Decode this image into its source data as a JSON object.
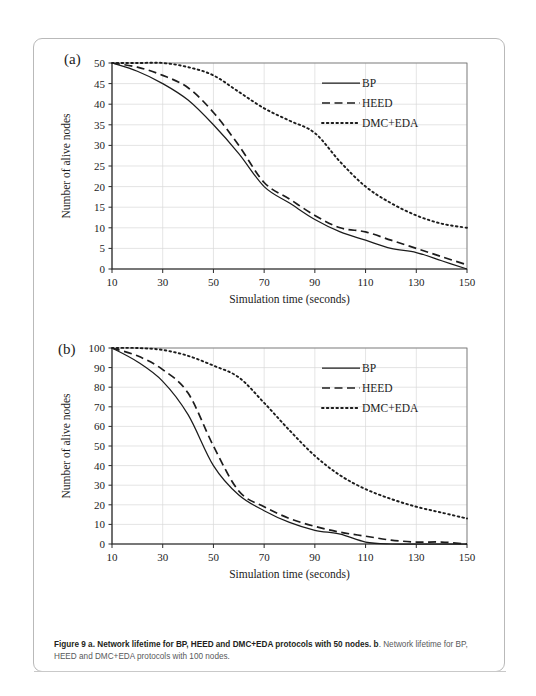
{
  "figure": {
    "caption_bold": "Figure 9 a. Network lifetime for BP, HEED and DMC+EDA protocols with 50 nodes.",
    "caption_b_bold": "b",
    "caption_rest": ". Network lifetime for BP, HEED and DMC+EDA protocols with 100 nodes."
  },
  "chart_data": [
    {
      "type": "line",
      "panel_label": "(a)",
      "title": "",
      "xlabel": "Simulation time (seconds)",
      "ylabel": "Number of alive nodes",
      "xlim": [
        10,
        150
      ],
      "ylim": [
        0,
        50
      ],
      "xticks": [
        10,
        30,
        50,
        70,
        90,
        110,
        130,
        150
      ],
      "yticks": [
        0,
        5,
        10,
        15,
        20,
        25,
        30,
        35,
        40,
        45,
        50
      ],
      "grid": true,
      "legend_position": "top-right",
      "x": [
        10,
        20,
        30,
        40,
        50,
        60,
        70,
        80,
        90,
        100,
        110,
        120,
        130,
        140,
        150
      ],
      "series": [
        {
          "name": "BP",
          "style": "solid",
          "values": [
            50,
            48,
            45,
            41,
            35,
            28,
            20,
            16,
            12,
            9,
            7,
            5,
            4,
            2,
            0
          ]
        },
        {
          "name": "HEED",
          "style": "dashed",
          "values": [
            50,
            49,
            47,
            44,
            38,
            30,
            21,
            17,
            13,
            10,
            9,
            7,
            5,
            3,
            1
          ]
        },
        {
          "name": "DMC+EDA",
          "style": "dotted",
          "values": [
            50,
            50,
            50,
            49,
            47,
            43,
            39,
            36,
            33,
            26,
            20,
            16,
            13,
            11,
            10
          ]
        }
      ]
    },
    {
      "type": "line",
      "panel_label": "(b)",
      "title": "",
      "xlabel": "Simulation time (seconds)",
      "ylabel": "Number of alive nodes",
      "xlim": [
        10,
        150
      ],
      "ylim": [
        0,
        100
      ],
      "xticks": [
        10,
        30,
        50,
        70,
        90,
        110,
        130,
        150
      ],
      "yticks": [
        0,
        10,
        20,
        30,
        40,
        50,
        60,
        70,
        80,
        90,
        100
      ],
      "grid": true,
      "legend_position": "top-right",
      "x": [
        10,
        20,
        30,
        40,
        50,
        60,
        70,
        80,
        90,
        100,
        110,
        120,
        130,
        140,
        150
      ],
      "series": [
        {
          "name": "BP",
          "style": "solid",
          "values": [
            100,
            93,
            83,
            66,
            40,
            25,
            17,
            11,
            7,
            5,
            1,
            0,
            0,
            0,
            0
          ]
        },
        {
          "name": "HEED",
          "style": "dashed",
          "values": [
            100,
            96,
            89,
            77,
            50,
            27,
            19,
            13,
            9,
            6,
            4,
            2,
            1,
            1,
            0
          ]
        },
        {
          "name": "DMC+EDA",
          "style": "dotted",
          "values": [
            100,
            100,
            99,
            96,
            91,
            85,
            72,
            58,
            45,
            35,
            28,
            23,
            19,
            16,
            13
          ]
        }
      ]
    }
  ]
}
